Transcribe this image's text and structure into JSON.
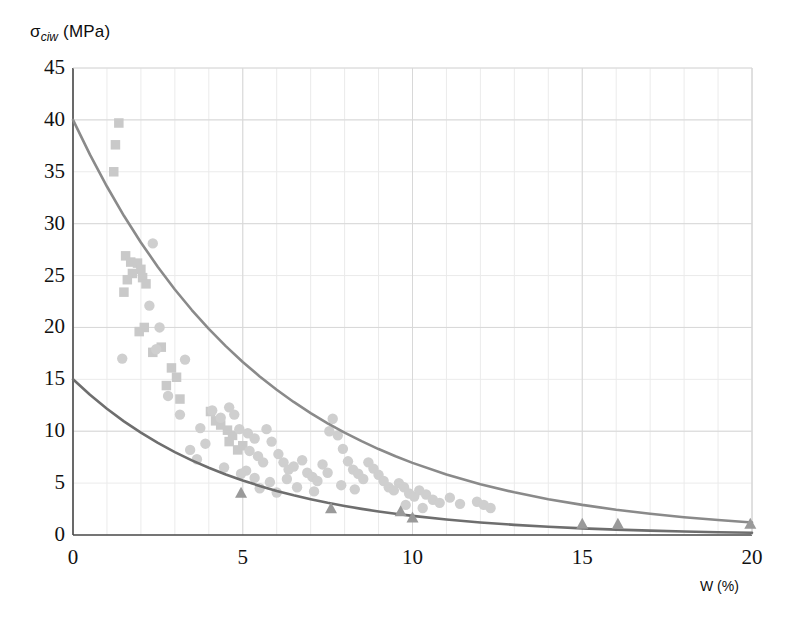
{
  "chart_data": {
    "type": "scatter",
    "title": "",
    "xlabel": "W (%)",
    "ylabel_main": "σ",
    "ylabel_sub": "ciw",
    "ylabel_unit": "(MPa)",
    "ylabel_full": "σciw (MPa)",
    "xlim": [
      0,
      20
    ],
    "ylim": [
      0,
      45
    ],
    "xticks": [
      0,
      5,
      10,
      15,
      20
    ],
    "yticks": [
      0,
      5,
      10,
      15,
      20,
      25,
      30,
      35,
      40,
      45
    ],
    "xtick_labels": [
      "0",
      "5",
      "10",
      "15",
      "20"
    ],
    "ytick_labels": [
      "0",
      "5",
      "10",
      "15",
      "20",
      "25",
      "30",
      "35",
      "40",
      "45"
    ],
    "grid": true,
    "grid_minor_step_x": 1,
    "grid_minor_step_y": 5,
    "grid_major_step_x": 5,
    "grid_major_step_y": 10,
    "legend": "none",
    "colors": {
      "curve_upper": "#8a8a8a",
      "curve_lower": "#6e6e6e",
      "marker_square": "#c9c9c9",
      "marker_circle": "#cfcfcf",
      "marker_triangle": "#9a9a9a",
      "grid_minor": "#ebebeb",
      "grid_major": "#d8d8d8",
      "axis": "#4a4a4a",
      "text": "#111111"
    },
    "series": [
      {
        "name": "upper-fit-curve",
        "type": "line",
        "marker": "none",
        "model": "exponential-decay",
        "y0": 40.0,
        "decay": 0.175,
        "offset": 0.0,
        "points": [
          [
            0.0,
            40.0
          ],
          [
            0.5,
            36.65
          ],
          [
            1.0,
            33.58
          ],
          [
            1.5,
            30.76
          ],
          [
            2.0,
            28.19
          ],
          [
            2.5,
            25.83
          ],
          [
            3.0,
            23.66
          ],
          [
            3.5,
            21.68
          ],
          [
            4.0,
            19.86
          ],
          [
            4.5,
            18.2
          ],
          [
            5.0,
            16.67
          ],
          [
            5.5,
            15.28
          ],
          [
            6.0,
            14.0
          ],
          [
            6.5,
            12.82
          ],
          [
            7.0,
            11.75
          ],
          [
            7.5,
            10.76
          ],
          [
            8.0,
            9.86
          ],
          [
            8.5,
            9.04
          ],
          [
            9.0,
            8.28
          ],
          [
            9.5,
            7.59
          ],
          [
            10.0,
            6.95
          ],
          [
            11.0,
            5.83
          ],
          [
            12.0,
            4.9
          ],
          [
            13.0,
            4.11
          ],
          [
            14.0,
            3.45
          ],
          [
            15.0,
            2.9
          ],
          [
            16.0,
            2.43
          ],
          [
            17.0,
            2.04
          ],
          [
            18.0,
            1.71
          ],
          [
            19.0,
            1.44
          ],
          [
            20.0,
            1.21
          ]
        ]
      },
      {
        "name": "lower-fit-curve",
        "type": "line",
        "marker": "none",
        "model": "exponential-decay",
        "y0": 15.0,
        "decay": 0.21,
        "offset": 0.0,
        "points": [
          [
            0.0,
            15.0
          ],
          [
            0.5,
            13.51
          ],
          [
            1.0,
            12.16
          ],
          [
            1.5,
            10.95
          ],
          [
            2.0,
            9.86
          ],
          [
            2.5,
            8.87
          ],
          [
            3.0,
            7.99
          ],
          [
            3.5,
            7.19
          ],
          [
            4.0,
            6.48
          ],
          [
            4.5,
            5.83
          ],
          [
            5.0,
            5.25
          ],
          [
            5.5,
            4.73
          ],
          [
            6.0,
            4.25
          ],
          [
            6.5,
            3.83
          ],
          [
            7.0,
            3.45
          ],
          [
            7.5,
            3.1
          ],
          [
            8.0,
            2.8
          ],
          [
            8.5,
            2.52
          ],
          [
            9.0,
            2.27
          ],
          [
            9.5,
            2.04
          ],
          [
            10.0,
            1.84
          ],
          [
            11.0,
            1.49
          ],
          [
            12.0,
            1.21
          ],
          [
            13.0,
            0.98
          ],
          [
            14.0,
            0.79
          ],
          [
            15.0,
            0.64
          ],
          [
            16.0,
            0.52
          ],
          [
            17.0,
            0.42
          ],
          [
            18.0,
            0.34
          ],
          [
            19.0,
            0.27
          ],
          [
            20.0,
            0.22
          ]
        ]
      },
      {
        "name": "square-markers",
        "type": "scatter",
        "marker": "square",
        "points": [
          [
            1.35,
            39.7
          ],
          [
            1.25,
            37.6
          ],
          [
            1.2,
            35.0
          ],
          [
            1.55,
            26.9
          ],
          [
            1.7,
            26.3
          ],
          [
            1.9,
            26.2
          ],
          [
            2.0,
            25.6
          ],
          [
            1.75,
            25.2
          ],
          [
            2.05,
            24.8
          ],
          [
            1.6,
            24.6
          ],
          [
            2.15,
            24.2
          ],
          [
            1.5,
            23.4
          ],
          [
            2.1,
            20.0
          ],
          [
            1.95,
            19.6
          ],
          [
            2.6,
            18.1
          ],
          [
            2.35,
            17.6
          ],
          [
            2.9,
            16.1
          ],
          [
            3.05,
            15.2
          ],
          [
            2.75,
            14.4
          ],
          [
            3.15,
            13.1
          ],
          [
            4.05,
            11.9
          ],
          [
            4.2,
            11.0
          ],
          [
            4.35,
            10.6
          ],
          [
            4.55,
            10.1
          ],
          [
            4.7,
            9.6
          ],
          [
            4.6,
            9.0
          ],
          [
            5.0,
            8.6
          ],
          [
            4.85,
            8.2
          ]
        ]
      },
      {
        "name": "circle-markers",
        "type": "scatter",
        "marker": "circle",
        "points": [
          [
            1.45,
            17.0
          ],
          [
            2.35,
            28.1
          ],
          [
            2.55,
            20.0
          ],
          [
            2.45,
            17.9
          ],
          [
            3.3,
            16.9
          ],
          [
            3.15,
            11.6
          ],
          [
            3.75,
            10.3
          ],
          [
            3.65,
            7.3
          ],
          [
            4.1,
            12.0
          ],
          [
            4.35,
            11.3
          ],
          [
            4.6,
            12.3
          ],
          [
            4.75,
            11.6
          ],
          [
            4.9,
            10.2
          ],
          [
            5.15,
            9.8
          ],
          [
            5.35,
            9.3
          ],
          [
            5.2,
            8.1
          ],
          [
            5.45,
            7.6
          ],
          [
            5.6,
            7.0
          ],
          [
            5.1,
            6.2
          ],
          [
            5.35,
            5.5
          ],
          [
            5.7,
            10.2
          ],
          [
            5.85,
            9.0
          ],
          [
            6.05,
            7.8
          ],
          [
            6.2,
            7.0
          ],
          [
            6.35,
            6.3
          ],
          [
            6.5,
            6.6
          ],
          [
            6.75,
            7.2
          ],
          [
            6.9,
            6.0
          ],
          [
            7.05,
            5.6
          ],
          [
            7.2,
            5.2
          ],
          [
            7.35,
            6.8
          ],
          [
            7.5,
            6.0
          ],
          [
            7.65,
            11.2
          ],
          [
            7.55,
            10.0
          ],
          [
            7.8,
            9.6
          ],
          [
            7.95,
            8.3
          ],
          [
            8.1,
            7.1
          ],
          [
            8.25,
            6.3
          ],
          [
            8.4,
            5.9
          ],
          [
            8.55,
            5.4
          ],
          [
            8.7,
            7.0
          ],
          [
            8.85,
            6.4
          ],
          [
            9.0,
            5.8
          ],
          [
            9.15,
            5.2
          ],
          [
            9.3,
            4.6
          ],
          [
            9.45,
            4.3
          ],
          [
            9.6,
            5.0
          ],
          [
            9.75,
            4.6
          ],
          [
            9.9,
            4.0
          ],
          [
            10.05,
            3.7
          ],
          [
            10.2,
            4.3
          ],
          [
            10.4,
            3.9
          ],
          [
            10.6,
            3.4
          ],
          [
            10.8,
            3.1
          ],
          [
            11.9,
            3.2
          ],
          [
            12.1,
            2.9
          ],
          [
            12.3,
            2.6
          ],
          [
            6.6,
            4.6
          ],
          [
            7.1,
            4.2
          ],
          [
            7.9,
            4.8
          ],
          [
            8.3,
            4.4
          ],
          [
            4.45,
            6.5
          ],
          [
            4.95,
            5.9
          ],
          [
            5.5,
            4.5
          ],
          [
            6.0,
            4.1
          ],
          [
            9.8,
            2.9
          ],
          [
            10.3,
            2.6
          ],
          [
            5.8,
            5.1
          ],
          [
            6.3,
            5.4
          ],
          [
            3.45,
            8.2
          ],
          [
            3.9,
            8.8
          ],
          [
            2.25,
            22.1
          ],
          [
            2.8,
            13.4
          ],
          [
            11.1,
            3.6
          ],
          [
            11.4,
            3.0
          ]
        ]
      },
      {
        "name": "triangle-markers",
        "type": "scatter",
        "marker": "triangle",
        "points": [
          [
            4.95,
            4.0
          ],
          [
            7.6,
            2.5
          ],
          [
            9.65,
            2.2
          ],
          [
            10.0,
            1.6
          ],
          [
            15.0,
            1.0
          ],
          [
            16.05,
            1.0
          ],
          [
            19.95,
            1.0
          ]
        ]
      }
    ]
  },
  "axes": {
    "plot_left_px": 73,
    "plot_right_px": 752,
    "plot_top_px": 68,
    "plot_bottom_px": 535
  }
}
